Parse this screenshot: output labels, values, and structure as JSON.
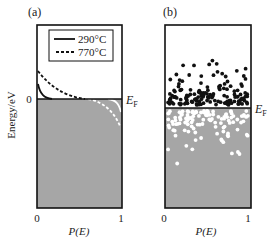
{
  "figure": {
    "panel_a": {
      "label": "(a)",
      "ylabel": "Energy/eV",
      "y_zero": "0",
      "fermi_label": "E",
      "fermi_sub": "F",
      "x_ticks": [
        "0",
        "1"
      ],
      "xlabel": "P(E)",
      "legend": [
        {
          "label": "290°C",
          "style": "solid"
        },
        {
          "label": "770°C",
          "style": "dashed"
        }
      ]
    },
    "panel_b": {
      "label": "(b)",
      "fermi_label": "E",
      "fermi_sub": "F",
      "x_ticks": [
        "0",
        "1"
      ],
      "xlabel": "P(E)"
    },
    "colors": {
      "filled": "#a6a6a6",
      "frame": "#111111",
      "electron": "#111111",
      "hole": "#ffffff"
    }
  }
}
